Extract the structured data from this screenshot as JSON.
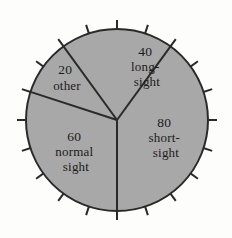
{
  "chart_data": {
    "type": "pie",
    "title": "",
    "xlabel": "",
    "ylabel": "",
    "total": 200,
    "units": "people",
    "legend": "none",
    "grid": false,
    "start_angle_deg": 324,
    "direction": "clockwise",
    "categories": [
      "long-sight",
      "short-sight",
      "normal sight",
      "other"
    ],
    "values": [
      40,
      80,
      60,
      20
    ],
    "angles_deg": [
      72,
      144,
      108,
      36
    ],
    "slices": [
      {
        "name": "long-sight",
        "value": 40,
        "value_text": "40",
        "label_lines": [
          "40",
          "long-",
          "sight"
        ],
        "angle_deg": 72,
        "start_deg": 324,
        "end_deg": 36,
        "percent": 20
      },
      {
        "name": "short-sight",
        "value": 80,
        "value_text": "80",
        "label_lines": [
          "80",
          "short-",
          "sight"
        ],
        "angle_deg": 144,
        "start_deg": 36,
        "end_deg": 180,
        "percent": 40
      },
      {
        "name": "normal sight",
        "value": 60,
        "value_text": "60",
        "label_lines": [
          "60",
          "normal",
          "sight"
        ],
        "angle_deg": 108,
        "start_deg": 180,
        "end_deg": 288,
        "percent": 30
      },
      {
        "name": "other",
        "value": 20,
        "value_text": "20",
        "label_lines": [
          "20",
          "other"
        ],
        "angle_deg": 36,
        "start_deg": 288,
        "end_deg": 324,
        "percent": 10
      }
    ],
    "ticks": {
      "count": 20,
      "step_deg": 18,
      "length_px": 9
    },
    "colors": {
      "slice_fill": "#a8a8a8",
      "outline": "#2a2a2a",
      "background": "#fdfdfb",
      "label_text": "#1b1b1b"
    },
    "geometry": {
      "center_x": 117,
      "center_y": 120,
      "radius": 91
    }
  },
  "labels": {
    "longsight": {
      "l0": "40",
      "l1": "long-",
      "l2": "sight"
    },
    "shortsight": {
      "l0": "80",
      "l1": "short-",
      "l2": "sight"
    },
    "normalsight": {
      "l0": "60",
      "l1": "normal",
      "l2": "sight"
    },
    "other": {
      "l0": "20",
      "l1": "other"
    }
  }
}
